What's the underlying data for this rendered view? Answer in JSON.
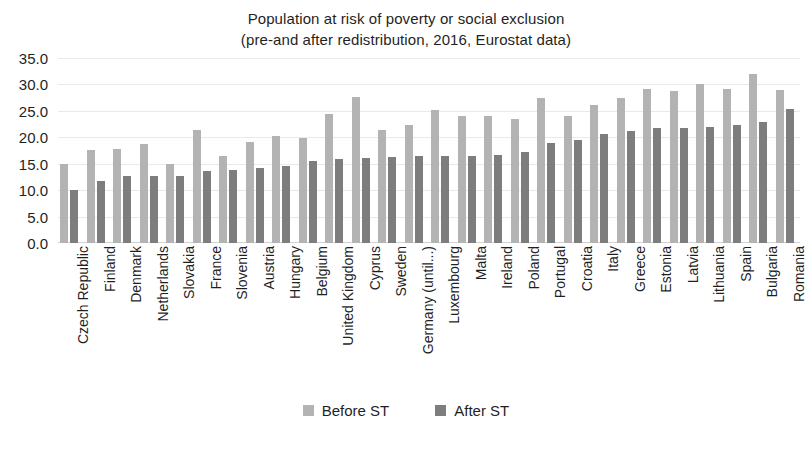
{
  "chart_data": {
    "type": "bar",
    "title": "Population at risk of poverty or social exclusion",
    "subtitle": "(pre-and after redistribution, 2016, Eurostat data)",
    "xlabel": "",
    "ylabel": "",
    "ylim": [
      0.0,
      35.0
    ],
    "ytick_step": 5.0,
    "ytick_labels": [
      "35.0",
      "30.0",
      "25.0",
      "20.0",
      "15.0",
      "10.0",
      "5.0",
      "0.0"
    ],
    "grid": true,
    "legend_position": "bottom",
    "colors": {
      "before": "#b3b3b3",
      "after": "#7d7d7d",
      "gridline": "#e9e9e9",
      "text": "#1f1f1f",
      "background": "#ffffff"
    },
    "categories": [
      "Czech Republic",
      "Finland",
      "Denmark",
      "Netherlands",
      "Slovakia",
      "France",
      "Slovenia",
      "Austria",
      "Hungary",
      "Belgium",
      "United Kingdom",
      "Cyprus",
      "Sweden",
      "Germany (until...)",
      "Luxembourg",
      "Malta",
      "Ireland",
      "Poland",
      "Portugal",
      "Croatia",
      "Italy",
      "Greece",
      "Estonia",
      "Latvia",
      "Lithuania",
      "Spain",
      "Bulgaria",
      "Romania"
    ],
    "series": [
      {
        "name": "Before ST",
        "color": "#b3b3b3",
        "values": [
          15.0,
          17.6,
          17.7,
          18.8,
          15.0,
          21.3,
          16.5,
          19.2,
          20.3,
          19.8,
          24.4,
          27.7,
          21.3,
          22.3,
          25.1,
          24.0,
          24.0,
          23.5,
          27.5,
          24.0,
          26.1,
          27.5,
          29.2,
          28.8,
          30.0,
          29.2,
          31.9,
          28.9
        ]
      },
      {
        "name": "After ST",
        "color": "#7d7d7d",
        "values": [
          10.0,
          11.8,
          12.7,
          12.7,
          12.7,
          13.6,
          13.9,
          14.1,
          14.5,
          15.5,
          15.9,
          16.1,
          16.2,
          16.5,
          16.5,
          16.5,
          16.6,
          17.3,
          19.0,
          19.5,
          20.6,
          21.2,
          21.7,
          21.8,
          21.9,
          22.3,
          22.9,
          25.3
        ]
      }
    ]
  },
  "legend": {
    "items": [
      {
        "label": "Before ST",
        "color": "#b3b3b3"
      },
      {
        "label": "After ST",
        "color": "#7d7d7d"
      }
    ]
  }
}
